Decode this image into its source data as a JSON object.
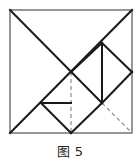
{
  "figure": {
    "caption": "图 5",
    "colors": {
      "solid_line": "#1a1a1a",
      "dashed_line": "#8a8a8a",
      "border_line": "#6b6b6b",
      "background": "#ffffff"
    },
    "square": {
      "left": 10,
      "top": 10,
      "right": 132,
      "bottom": 133,
      "label": "outer-square"
    },
    "points": {
      "top_left": [
        10,
        10
      ],
      "top_right": [
        132,
        10
      ],
      "bottom_left": [
        10,
        133
      ],
      "bottom_right": [
        132,
        133
      ],
      "center_cross": [
        71,
        72
      ],
      "right_vertical_top": [
        102,
        43
      ],
      "right_vertical_bottom": [
        102,
        103
      ],
      "diamond_right": [
        132,
        72
      ],
      "small_triangle_apex": [
        41,
        103
      ],
      "bottom_mid": [
        71,
        133
      ]
    },
    "solid_segments": [
      {
        "name": "square-top-edge",
        "from": [
          10,
          10
        ],
        "to": [
          132,
          10
        ]
      },
      {
        "name": "square-right-edge",
        "from": [
          132,
          10
        ],
        "to": [
          132,
          133
        ]
      },
      {
        "name": "square-bottom-edge",
        "from": [
          132,
          133
        ],
        "to": [
          10,
          133
        ]
      },
      {
        "name": "square-left-edge",
        "from": [
          10,
          133
        ],
        "to": [
          10,
          10
        ]
      },
      {
        "name": "main-diagonal-tl-to-br-partial",
        "from": [
          10,
          10
        ],
        "to": [
          102,
          103
        ]
      },
      {
        "name": "diagonal-tr-to-bl",
        "from": [
          132,
          10
        ],
        "to": [
          10,
          133
        ]
      },
      {
        "name": "diagonal-center-to-bottom-right",
        "from": [
          71,
          72
        ],
        "to": [
          102,
          103
        ]
      },
      {
        "name": "diagonal-right-vertical-top-to-center",
        "from": [
          102,
          43
        ],
        "to": [
          71,
          72
        ]
      },
      {
        "name": "diamond-upper-right-edge",
        "from": [
          102,
          43
        ],
        "to": [
          132,
          72
        ]
      },
      {
        "name": "diamond-lower-right-edge",
        "from": [
          132,
          72
        ],
        "to": [
          102,
          103
        ]
      },
      {
        "name": "right-vertical-line",
        "from": [
          102,
          43
        ],
        "to": [
          102,
          103
        ]
      },
      {
        "name": "bottom-right-to-bottom-mid",
        "from": [
          102,
          103
        ],
        "to": [
          71,
          133
        ]
      },
      {
        "name": "bottom-mid-to-small-triangle-apex",
        "from": [
          71,
          133
        ],
        "to": [
          41,
          103
        ]
      },
      {
        "name": "small-triangle-horizontal",
        "from": [
          41,
          103
        ],
        "to": [
          71,
          103
        ]
      }
    ],
    "dashed_segments": [
      {
        "name": "center-vertical-dashed",
        "from": [
          71,
          72
        ],
        "to": [
          71,
          133
        ]
      },
      {
        "name": "diamond-diagonal-dashed",
        "from": [
          102,
          43
        ],
        "to": [
          132,
          72
        ]
      },
      {
        "name": "bottom-right-corner-dashed",
        "from": [
          102,
          103
        ],
        "to": [
          132,
          133
        ]
      }
    ]
  }
}
